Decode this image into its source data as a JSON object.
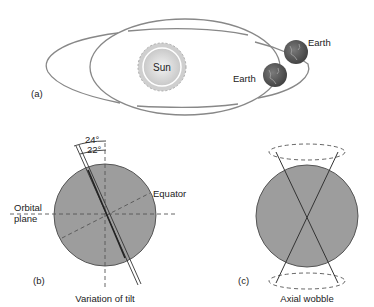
{
  "panels": {
    "a": {
      "label": "(a)",
      "sun_label": "Sun",
      "earth_label_1": "Earth",
      "earth_label_2": "Earth"
    },
    "b": {
      "label": "(b)",
      "caption": "Variation of tilt",
      "angle_outer": "24°",
      "angle_inner": "22°",
      "equator_label": "Equator",
      "orbital_plane_line1": "Orbital",
      "orbital_plane_line2": "plane"
    },
    "c": {
      "label": "(c)",
      "caption": "Axial wobble"
    }
  },
  "colors": {
    "line": "#777777",
    "sphere_fill": "#9a9a9a",
    "sun_fill": "#d8d8d8",
    "earth_fill": "#555555"
  }
}
